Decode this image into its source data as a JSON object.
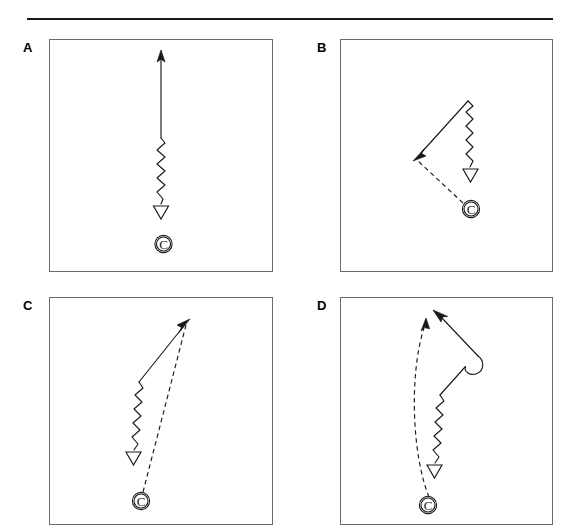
{
  "figure": {
    "panels": [
      {
        "id": "A",
        "label": "A",
        "marker_label": "C",
        "marker_name": "circled-c-marker",
        "description": "vertical trajectory: solid arrow up, wavy segment, open triangle down, circled C below"
      },
      {
        "id": "B",
        "label": "B",
        "marker_label": "C",
        "marker_name": "circled-c-marker",
        "description": "apex at upper right, solid arrow down-left, wavy segment down with open triangle, dashed line from circled C"
      },
      {
        "id": "C",
        "label": "C",
        "marker_label": "C",
        "marker_name": "circled-c-marker",
        "description": "solid arrow up-right, wavy segment down with open triangle, dashed line from circled C to arrowhead"
      },
      {
        "id": "D",
        "label": "D",
        "marker_label": "C",
        "marker_name": "circled-c-marker",
        "description": "looped curl at right, solid arrow up-left, wavy segment down with open triangle, curved dashed line from circled C with arrowhead"
      }
    ],
    "colors": {
      "ink": "#1a1a1a",
      "panel_border": "#6b6b6b",
      "background": "#ffffff"
    }
  }
}
